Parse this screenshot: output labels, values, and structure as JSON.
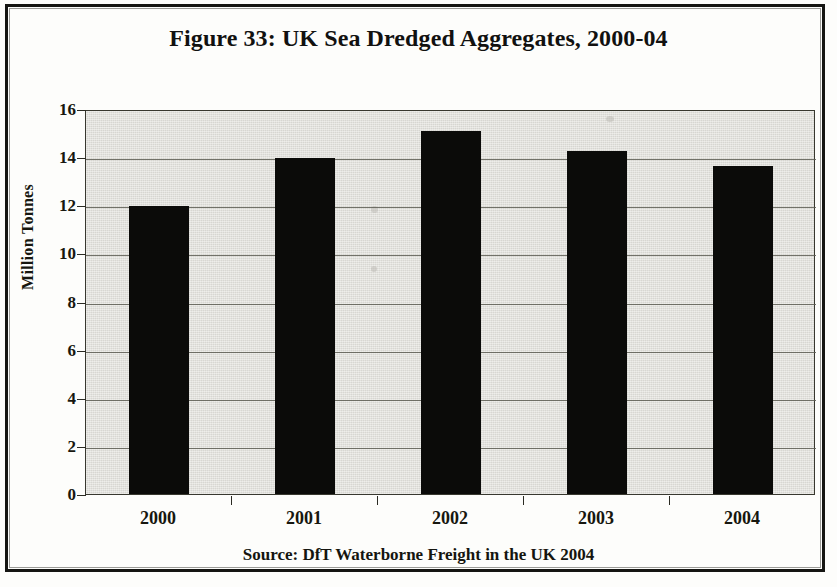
{
  "figure": {
    "title": "Figure 33: UK Sea Dredged Aggregates, 2000-04",
    "source": "Source: DfT Waterborne Freight in the UK 2004"
  },
  "chart_data": {
    "type": "bar",
    "title": "Figure 33: UK Sea Dredged Aggregates, 2000-04",
    "categories": [
      "2000",
      "2001",
      "2002",
      "2003",
      "2004"
    ],
    "values": [
      11.95,
      13.95,
      15.1,
      14.25,
      13.65
    ],
    "xlabel": "",
    "ylabel": "Million Tonnes",
    "ylim": [
      0,
      16
    ],
    "ytick_labels": [
      "16",
      "14",
      "12",
      "10",
      "8",
      "6",
      "4",
      "2",
      "0"
    ],
    "ytick_values": [
      16,
      14,
      12,
      10,
      8,
      6,
      4,
      2,
      0
    ],
    "ytick_step": 2,
    "grid": true,
    "grid_axis": "y",
    "legend": null,
    "bar_color": "#0b0b09",
    "plot_background": "#e4e3de",
    "annotations": [
      "Source: DfT Waterborne Freight in the UK 2004"
    ]
  }
}
